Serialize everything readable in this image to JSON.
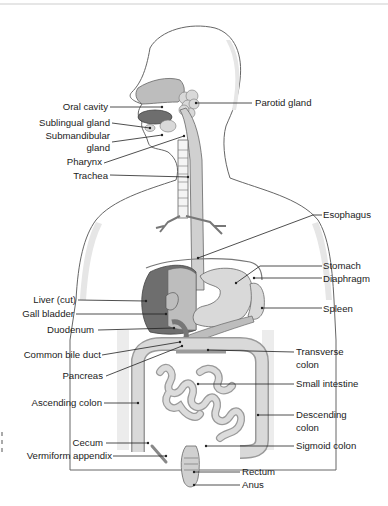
{
  "diagram": {
    "labels_left": [
      {
        "id": "oral-cavity",
        "text": "Oral cavity"
      },
      {
        "id": "sublingual-gland",
        "text": "Sublingual gland"
      },
      {
        "id": "submandibular-gland",
        "text": "Submandibular gland"
      },
      {
        "id": "pharynx",
        "text": "Pharynx"
      },
      {
        "id": "trachea",
        "text": "Trachea"
      },
      {
        "id": "liver",
        "text": "Liver (cut)"
      },
      {
        "id": "gall-bladder",
        "text": "Gall bladder"
      },
      {
        "id": "duodenum",
        "text": "Duodenum"
      },
      {
        "id": "common-bile-duct",
        "text": "Common bile duct"
      },
      {
        "id": "pancreas",
        "text": "Pancreas"
      },
      {
        "id": "ascending-colon",
        "text": "Ascending colon"
      },
      {
        "id": "cecum",
        "text": "Cecum"
      },
      {
        "id": "vermiform-appendix",
        "text": "Vermiform appendix"
      }
    ],
    "labels_right": [
      {
        "id": "parotid-gland",
        "text": "Parotid gland"
      },
      {
        "id": "esophagus",
        "text": "Esophagus"
      },
      {
        "id": "stomach",
        "text": "Stomach"
      },
      {
        "id": "diaphragm",
        "text": "Diaphragm"
      },
      {
        "id": "spleen",
        "text": "Spleen"
      },
      {
        "id": "transverse-colon",
        "text": "Transverse colon"
      },
      {
        "id": "small-intestine",
        "text": "Small intestine"
      },
      {
        "id": "descending-colon",
        "text": "Descending colon"
      },
      {
        "id": "sigmoid-colon",
        "text": "Sigmoid colon"
      },
      {
        "id": "rectum",
        "text": "Rectum"
      },
      {
        "id": "anus",
        "text": "Anus"
      }
    ],
    "label_lines": {
      "submandibular_line1": "Submandibular",
      "submandibular_line2": "gland",
      "transverse_line1": "Transverse",
      "transverse_line2": "colon",
      "descending_line1": "Descending",
      "descending_line2": "colon"
    },
    "colors": {
      "outline": "#555555",
      "organ_light": "#d9d9d9",
      "organ_mid": "#bdbdbd",
      "organ_dark": "#6e6e6e",
      "body_fill": "#ffffff",
      "shadow": "#e3e3e3"
    }
  }
}
